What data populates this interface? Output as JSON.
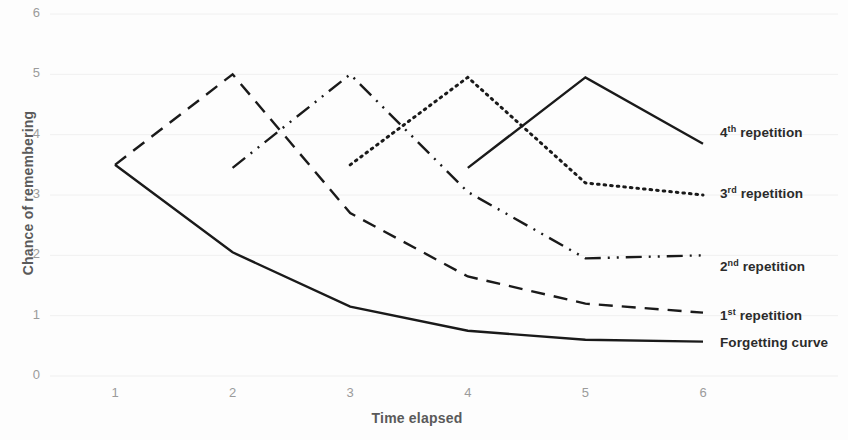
{
  "chart_data": {
    "type": "line",
    "title": "",
    "xlabel": "Time elapsed",
    "ylabel": "Chance of remembering",
    "xlim": [
      1,
      6
    ],
    "ylim": [
      0,
      6
    ],
    "x": [
      1,
      2,
      3,
      4,
      5,
      6
    ],
    "xticks": [
      "1",
      "2",
      "3",
      "4",
      "5",
      "6"
    ],
    "yticks": [
      "0",
      "1",
      "2",
      "3",
      "4",
      "5",
      "6"
    ],
    "grid": true,
    "grid_color": "#f0f0f0",
    "legend_position": "right-inline-at-line-ends",
    "line_color": "#1a1a1a",
    "series": [
      {
        "name": "Forgetting curve",
        "label_html": "Forgetting curve",
        "dash": "solid",
        "points": [
          [
            1,
            3.5
          ],
          [
            2,
            2.05
          ],
          [
            3,
            1.15
          ],
          [
            4,
            0.75
          ],
          [
            5,
            0.6
          ],
          [
            6,
            0.57
          ]
        ]
      },
      {
        "name": "1st repetition",
        "label_html": "1<sup>st</sup> repetition",
        "dash": "dashed",
        "points": [
          [
            1,
            3.5
          ],
          [
            2,
            5.0
          ],
          [
            3,
            2.7
          ],
          [
            4,
            1.65
          ],
          [
            5,
            1.2
          ],
          [
            6,
            1.05
          ]
        ]
      },
      {
        "name": "2nd repetition",
        "label_html": "2<sup>nd</sup> repetition",
        "dash": "dashdot",
        "points": [
          [
            2,
            3.45
          ],
          [
            3,
            5.0
          ],
          [
            4,
            3.05
          ],
          [
            5,
            1.95
          ],
          [
            6,
            2.0
          ]
        ]
      },
      {
        "name": "3rd repetition",
        "label_html": "3<sup>rd</sup> repetition",
        "dash": "dotted",
        "points": [
          [
            3,
            3.5
          ],
          [
            4,
            4.95
          ],
          [
            5,
            3.2
          ],
          [
            6,
            3.0
          ]
        ]
      },
      {
        "name": "4th repetition",
        "label_html": "4<sup>th</sup> repetition",
        "dash": "solid",
        "points": [
          [
            4,
            3.45
          ],
          [
            5,
            4.95
          ],
          [
            6,
            3.85
          ]
        ]
      }
    ]
  },
  "axes": {
    "y_title": "Chance of remembering",
    "x_title": "Time elapsed",
    "y_ticks": [
      "6",
      "5",
      "4",
      "3",
      "2",
      "1",
      "0"
    ],
    "x_ticks": [
      "1",
      "2",
      "3",
      "4",
      "5",
      "6"
    ]
  },
  "legend": {
    "items": [
      {
        "id": "rep4",
        "ordinal": "4",
        "suffix": "th",
        "word": "repetition"
      },
      {
        "id": "rep3",
        "ordinal": "3",
        "suffix": "rd",
        "word": "repetition"
      },
      {
        "id": "rep2",
        "ordinal": "2",
        "suffix": "nd",
        "word": "repetition"
      },
      {
        "id": "rep1",
        "ordinal": "1",
        "suffix": "st",
        "word": "repetition"
      },
      {
        "id": "forgetting",
        "ordinal": "",
        "suffix": "",
        "word": "Forgetting curve"
      }
    ]
  }
}
